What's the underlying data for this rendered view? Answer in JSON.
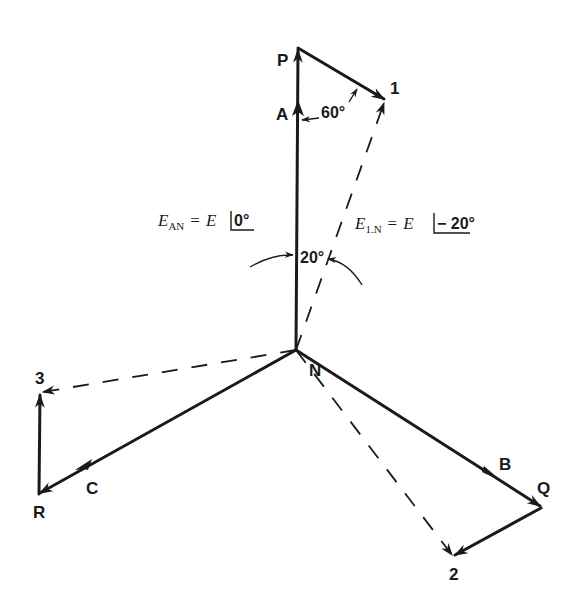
{
  "diagram": {
    "type": "phasor-diagram",
    "colors": {
      "ink": "#1a1a1a",
      "background": "#ffffff"
    },
    "nodes": {
      "N": {
        "label": "N",
        "x": 296,
        "y": 350
      },
      "P": {
        "label": "P",
        "x": 298,
        "y": 48
      },
      "Q": {
        "label": "Q",
        "x": 541,
        "y": 508
      },
      "R": {
        "label": "R",
        "x": 38,
        "y": 494
      },
      "pt1": {
        "label": "1",
        "x": 385,
        "y": 100
      },
      "pt2": {
        "label": "2",
        "x": 454,
        "y": 557
      },
      "pt3": {
        "label": "3",
        "x": 40,
        "y": 393
      }
    },
    "phase_labels": {
      "A": "A",
      "B": "B",
      "C": "C"
    },
    "angles": {
      "top": "60°",
      "middle": "20°"
    },
    "equations": {
      "ean": {
        "var": "E",
        "sub": "AN",
        "eq": "=",
        "rhs": "E",
        "angle": "0°"
      },
      "e1n": {
        "var": "E",
        "sub": "1.N",
        "eq": "=",
        "rhs": "E",
        "angle": "− 20°"
      }
    },
    "solid_vectors": [
      {
        "from": "N",
        "to": "P",
        "label": "A"
      },
      {
        "from": "N",
        "to": "Q",
        "label": "B"
      },
      {
        "from": "N",
        "to": "R",
        "label": "C"
      },
      {
        "from": "P",
        "to": "pt1"
      },
      {
        "from": "Q",
        "to": "pt2"
      },
      {
        "from": "R",
        "to": "pt3"
      }
    ],
    "dashed_vectors": [
      {
        "from": "N",
        "to": "pt1"
      },
      {
        "from": "N",
        "to": "pt2"
      },
      {
        "from": "N",
        "to": "pt3"
      }
    ]
  }
}
